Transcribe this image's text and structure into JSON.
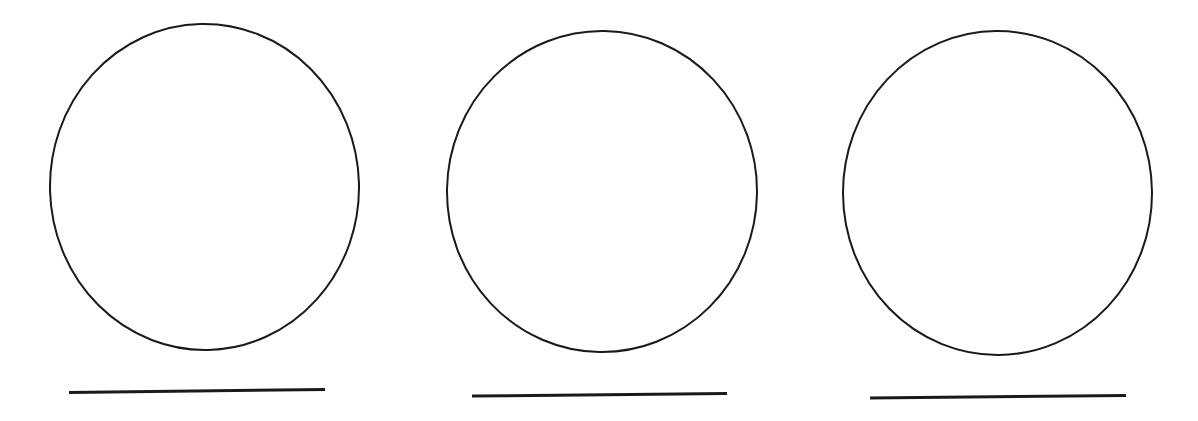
{
  "page": {
    "background_color": "#ffffff",
    "width": 1198,
    "height": 421
  },
  "style": {
    "ink_color": "#1a1a1a",
    "circle_stroke_width": 2.0,
    "line_stroke_width": 3.0
  },
  "figures": [
    {
      "id": "figure-1",
      "label": "Circle 1 over line 1",
      "circle": {
        "name": "circle-outline-1",
        "cx": 204.5,
        "cy": 187.0,
        "rx": 154.5,
        "ry": 163.0,
        "rotation": -1.5
      },
      "line": {
        "name": "ground-line-1",
        "x1": 69,
        "y1": 392.5,
        "x2": 325,
        "y2": 389.5,
        "length": 256
      }
    },
    {
      "id": "figure-2",
      "label": "Circle 2 over line 2",
      "circle": {
        "name": "circle-outline-2",
        "cx": 602.0,
        "cy": 191.5,
        "rx": 155.0,
        "ry": 160.5,
        "rotation": 1.0
      },
      "line": {
        "name": "ground-line-2",
        "x1": 472,
        "y1": 396.0,
        "x2": 727,
        "y2": 393.5,
        "length": 255
      }
    },
    {
      "id": "figure-3",
      "label": "Circle 3 over line 3",
      "circle": {
        "name": "circle-outline-3",
        "cx": 997.5,
        "cy": 193.0,
        "rx": 154.5,
        "ry": 162.0,
        "rotation": -0.5
      },
      "line": {
        "name": "ground-line-3",
        "x1": 870,
        "y1": 398.0,
        "x2": 1126,
        "y2": 395.5,
        "length": 256
      }
    }
  ],
  "chart_data": {
    "type": "scatter",
    "title": "",
    "xlabel": "",
    "ylabel": "",
    "grid": false,
    "legend": null,
    "xlim": [
      0,
      1198
    ],
    "ylim": [
      421,
      0
    ],
    "annotations": [
      "circle 1 centered at (204, 187), radius about 155 x 163",
      "circle 2 centered at (602, 192), radius about 155 x 161",
      "circle 3 centered at (998, 193), radius about 155 x 162",
      "line 1 from (69, 392) to (325, 390)",
      "line 2 from (472, 396) to (727, 394)",
      "line 3 from (870, 398) to (1126, 396)"
    ]
  }
}
